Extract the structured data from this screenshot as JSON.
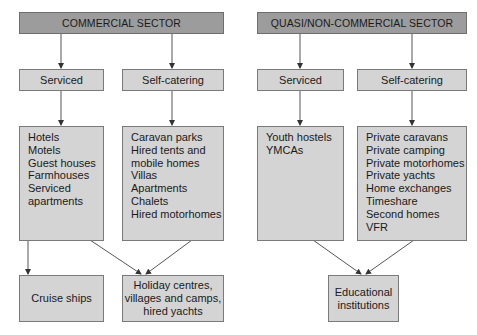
{
  "commercial": {
    "header": "COMMERCIAL SECTOR",
    "serviced": {
      "label": "Serviced",
      "items": [
        "Hotels",
        "Motels",
        "Guest houses",
        "Farmhouses",
        "Serviced",
        "apartments"
      ]
    },
    "self_catering": {
      "label": "Self-catering",
      "items": [
        "Caravan parks",
        "Hired tents and",
        "mobile homes",
        "Villas",
        "Apartments",
        "Chalets",
        "Hired motorhomes"
      ]
    },
    "outputs": {
      "cruise": "Cruise ships",
      "holiday": [
        "Holiday centres,",
        "villages and camps,",
        "hired yachts"
      ]
    }
  },
  "quasi": {
    "header": "QUASI/NON-COMMERCIAL SECTOR",
    "serviced": {
      "label": "Serviced",
      "items": [
        "Youth hostels",
        "YMCAs"
      ]
    },
    "self_catering": {
      "label": "Self-catering",
      "items": [
        "Private caravans",
        "Private camping",
        "Private motorhomes",
        "Private yachts",
        "Home exchanges",
        "Timeshare",
        "Second homes",
        "VFR"
      ]
    },
    "outputs": {
      "educational": [
        "Educational",
        "institutions"
      ]
    }
  },
  "colors": {
    "header_fill": "#9c9c9c",
    "box_fill": "#d4d4d4",
    "border": "#7a7a7a",
    "arrow": "#555555"
  }
}
